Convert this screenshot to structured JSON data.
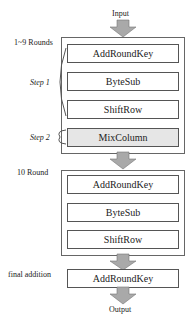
{
  "input_label": "Input",
  "output_label": "Output",
  "group1": {
    "label": "1~9 Rounds",
    "steps": [
      "AddRoundKey",
      "ByteSub",
      "ShiftRow",
      "MixColumn"
    ],
    "step1_label": "Step 1",
    "step2_label": "Step 2"
  },
  "group2": {
    "label": "10 Round",
    "steps": [
      "AddRoundKey",
      "ByteSub",
      "ShiftRow"
    ]
  },
  "final": {
    "label": "final addition",
    "step": "AddRoundKey"
  },
  "colors": {
    "arrow": "#a9a9a9",
    "mixcolumn_fill": "#e6e6e6"
  }
}
